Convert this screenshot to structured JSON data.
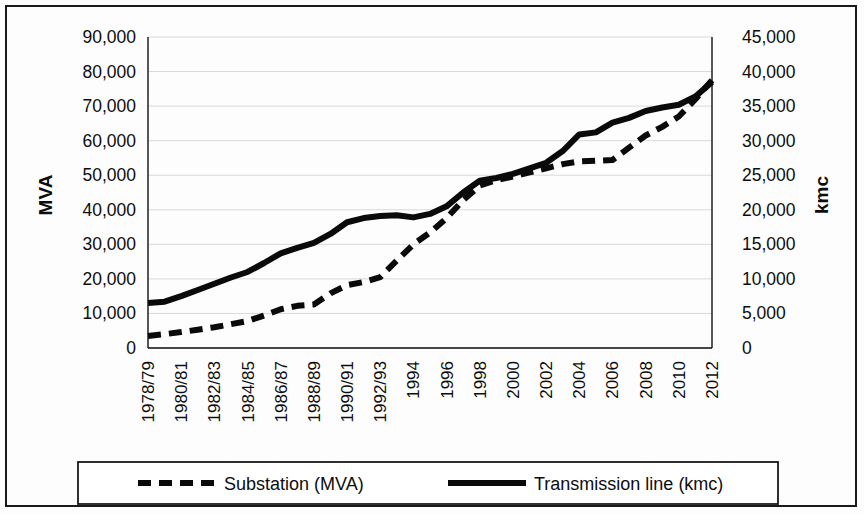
{
  "chart_data": {
    "type": "line",
    "title": "",
    "subtitle": "",
    "xlabel": "",
    "ylabel": "MVA",
    "y2label": "kmc",
    "grid": true,
    "legend_position": "bottom",
    "ylim": [
      0,
      90000
    ],
    "y2lim": [
      0,
      45000
    ],
    "ytick_labels": [
      "90,000",
      "80,000",
      "70,000",
      "60,000",
      "50,000",
      "40,000",
      "30,000",
      "20,000",
      "10,000",
      "0"
    ],
    "ytick_values": [
      90000,
      80000,
      70000,
      60000,
      50000,
      40000,
      30000,
      20000,
      10000,
      0
    ],
    "y2tick_labels": [
      "45,000",
      "40,000",
      "35,000",
      "30,000",
      "25,000",
      "20,000",
      "15,000",
      "10,000",
      "5,000",
      "0"
    ],
    "y2tick_values": [
      45000,
      40000,
      35000,
      30000,
      25000,
      20000,
      15000,
      10000,
      5000,
      0
    ],
    "categories": [
      "1978/79",
      "1979/80",
      "1980/81",
      "1981/82",
      "1982/83",
      "1983/84",
      "1984/85",
      "1985/86",
      "1986/87",
      "1987/88",
      "1988/89",
      "1989/90",
      "1990/91",
      "1991/92",
      "1992/93",
      "1993/94",
      "1994",
      "1995",
      "1996",
      "1997",
      "1998",
      "1999",
      "2000",
      "2001",
      "2002",
      "2003",
      "2004",
      "2005",
      "2006",
      "2007",
      "2008",
      "2009",
      "2010",
      "2011",
      "2012"
    ],
    "xtick_labels": [
      "1978/79",
      "1980/81",
      "1982/83",
      "1984/85",
      "1986/87",
      "1988/89",
      "1990/91",
      "1992/93",
      "1994",
      "1996",
      "1998",
      "2000",
      "2002",
      "2004",
      "2006",
      "2008",
      "2010",
      "2012"
    ],
    "xtick_indices": [
      0,
      2,
      4,
      6,
      8,
      10,
      12,
      14,
      16,
      18,
      20,
      22,
      24,
      26,
      28,
      30,
      32,
      34
    ],
    "series": [
      {
        "name": "Substation (MVA)",
        "axis": "left",
        "style": "dashed",
        "unit": "MVA",
        "values": [
          3500,
          4000,
          4600,
          5300,
          6000,
          6900,
          7800,
          9400,
          11200,
          12200,
          12600,
          15800,
          18200,
          19100,
          20500,
          25300,
          30000,
          33400,
          37600,
          42800,
          47000,
          48600,
          49600,
          50800,
          52000,
          53200,
          54000,
          54200,
          54400,
          58000,
          61500,
          64000,
          67000,
          72000,
          77500
        ]
      },
      {
        "name": "Transmission line (kmc)",
        "axis": "right",
        "style": "solid",
        "unit": "kmc",
        "values": [
          6500,
          6700,
          7500,
          8400,
          9300,
          10200,
          11000,
          12300,
          13700,
          14500,
          15200,
          16500,
          18200,
          18800,
          19100,
          19200,
          18900,
          19400,
          20500,
          22500,
          24200,
          24600,
          25200,
          26000,
          26800,
          28500,
          30900,
          31200,
          32600,
          33300,
          34300,
          34800,
          35200,
          36400,
          38500
        ]
      }
    ]
  },
  "legend": {
    "items": [
      {
        "label": "Substation (MVA)",
        "style": "dashed"
      },
      {
        "label": "Transmission line (kmc)",
        "style": "solid"
      }
    ]
  },
  "axes": {
    "left_title": "MVA",
    "right_title": "kmc"
  }
}
